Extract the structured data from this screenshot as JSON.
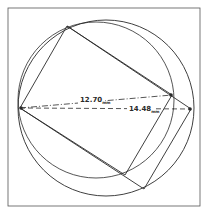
{
  "diagram": {
    "type": "geometric-construction",
    "frame": {
      "x": 8,
      "y": 8,
      "width": 192,
      "height": 198
    },
    "circles": [
      {
        "name": "outer-circle",
        "cx": 106,
        "cy": 108,
        "r": 88
      },
      {
        "name": "inner-circle",
        "cx": 96,
        "cy": 100,
        "r": 78
      }
    ],
    "rectangles": [
      {
        "name": "inner-rectangle",
        "points": [
          [
            20,
            108
          ],
          [
            67,
            26
          ],
          [
            172,
            95
          ],
          [
            125,
            175
          ]
        ]
      },
      {
        "name": "outer-rectangle",
        "points": [
          [
            20,
            108
          ],
          [
            67,
            26
          ],
          [
            191,
            109
          ],
          [
            144,
            189
          ]
        ]
      }
    ],
    "measurements": [
      {
        "name": "measure-short",
        "value": "12.70",
        "unit": "mm",
        "from": [
          20,
          108
        ],
        "to": [
          172,
          95
        ],
        "style": "dash-dot"
      },
      {
        "name": "measure-long",
        "value": "14.48",
        "unit": "mm",
        "from": [
          20,
          108
        ],
        "to": [
          191,
          109
        ],
        "style": "dashed"
      }
    ],
    "stroke_color": "#2a2a2a",
    "background_color": "#ffffff"
  }
}
